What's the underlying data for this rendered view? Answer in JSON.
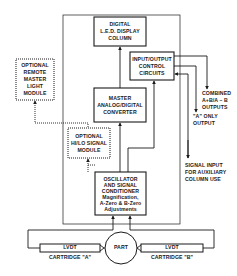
{
  "diagram": {
    "colors": {
      "line": "#1a1a1a",
      "background": "#ffffff"
    },
    "blocks": {
      "led_display": {
        "lines": [
          "DIGITAL",
          "L.E.D. DISPLAY",
          "COLUMN"
        ]
      },
      "io_control": {
        "lines": [
          "INPUT/OUTPUT",
          "CONTROL",
          "CIRCUITS"
        ]
      },
      "remote_light": {
        "lines": [
          "OPTIONAL",
          "REMOTE",
          "MASTER",
          "LIGHT",
          "MODULE"
        ],
        "style": "dotted"
      },
      "adc": {
        "lines": [
          "MASTER",
          "ANALOG/DIGITAL",
          "CONVERTER"
        ]
      },
      "hilo": {
        "lines": [
          "OPTIONAL",
          "HI/LO SIGNAL",
          "MODULE"
        ],
        "style": "dotted"
      },
      "oscillator": {
        "lines": [
          "OSCILLATOR",
          "AND SIGNAL",
          "CONDITIONER",
          "Magnification,",
          "A-Zero & B-Zero",
          "Adjustments"
        ]
      },
      "part": {
        "label": "PART"
      },
      "lvdt_a": {
        "label": "LVDT",
        "caption": "CARTRIDGE \"A\""
      },
      "lvdt_b": {
        "label": "LVDT",
        "caption": "CARTRIDGE \"B\""
      }
    },
    "outputs": {
      "combined": {
        "lines": [
          "COMBINED",
          "A+B/A – B",
          "OUTPUTS"
        ]
      },
      "a_only": {
        "lines": [
          "\"A\" ONLY",
          "OUTPUT"
        ]
      },
      "aux_input": {
        "lines": [
          "SIGNAL INPUT",
          "FOR AUXILIARY",
          "COLUMN USE"
        ]
      }
    }
  }
}
